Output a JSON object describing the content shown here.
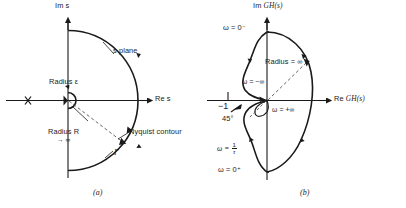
{
  "figure": {
    "type": "technical-diagram",
    "panels": [
      {
        "id": "a",
        "caption": "(a)",
        "plane_label": "s plane",
        "axes": {
          "vertical": {
            "label_prefix": "Im",
            "label_var": "s"
          },
          "horizontal": {
            "label_prefix": "Re",
            "label_var": "s"
          }
        },
        "annotations": {
          "radius_epsilon": "Radius ε",
          "radius_r": "Radius R",
          "radius_r_limit": "→ ∞",
          "nyquist_contour": "Nyquist contour",
          "gamma": "Γ"
        },
        "markers": {
          "pole_cross": "pole-cross-marker"
        }
      },
      {
        "id": "b",
        "caption": "(b)",
        "axes": {
          "vertical": {
            "label_prefix": "Im",
            "label_var": "GH(s)"
          },
          "horizontal": {
            "label_prefix": "Re",
            "label_var": "GH(s)"
          }
        },
        "annotations": {
          "omega_zero_minus": "ω = 0⁻",
          "omega_zero_plus": "ω = 0⁺",
          "omega_minus_inf": "ω = −∞",
          "omega_plus_inf": "ω = +∞",
          "omega_one_over_tau_prefix": "ω =",
          "omega_one_over_tau_num": "1",
          "omega_one_over_tau_den": "τ",
          "radius_inf": "Radius = ∞",
          "critical_point": "−1",
          "angle": "45°"
        }
      }
    ],
    "colors": {
      "ink": "#1a1a1a",
      "background": "#ffffff",
      "dashed": "#555555"
    }
  }
}
